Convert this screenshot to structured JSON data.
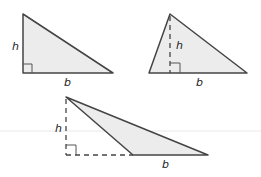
{
  "colors": {
    "fill": "#ececec",
    "stroke": "#444444",
    "guide": "#e6e6e6"
  },
  "triangles": [
    {
      "type": "right",
      "height_label": "h",
      "base_label": "b"
    },
    {
      "type": "acute",
      "height_label": "h",
      "base_label": "b"
    },
    {
      "type": "obtuse",
      "height_label": "h",
      "base_label": "b"
    }
  ]
}
